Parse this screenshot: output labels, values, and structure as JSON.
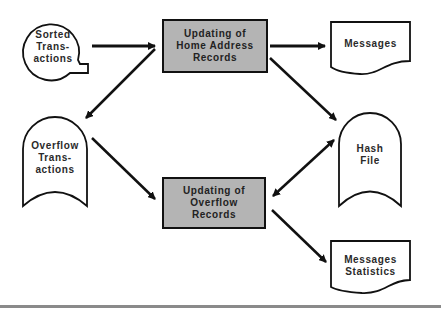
{
  "diagram": {
    "nodes": {
      "sorted_transactions": {
        "type": "terminal-tape",
        "label": "Sorted\nTrans-\nactions"
      },
      "update_home": {
        "type": "process",
        "label": "Updating of\nHome  Address\nRecords"
      },
      "messages": {
        "type": "document",
        "label": "Messages"
      },
      "overflow_transactions": {
        "type": "storage",
        "label": "Overflow\nTrans-\nactions"
      },
      "hash_file": {
        "type": "storage",
        "label": "Hash\nFile"
      },
      "update_overflow": {
        "type": "process",
        "label": "Updating of\nOverflow\nRecords"
      },
      "messages_statistics": {
        "type": "document",
        "label": "Messages\nStatistics"
      }
    },
    "edges": [
      {
        "from": "sorted_transactions",
        "to": "update_home"
      },
      {
        "from": "update_home",
        "to": "messages"
      },
      {
        "from": "update_home",
        "to": "overflow_transactions"
      },
      {
        "from": "update_home",
        "to": "hash_file"
      },
      {
        "from": "overflow_transactions",
        "to": "update_overflow"
      },
      {
        "from": "update_overflow",
        "to": "hash_file",
        "bidirectional": true
      },
      {
        "from": "update_overflow",
        "to": "messages_statistics"
      }
    ],
    "colors": {
      "process_fill": "#b4b4b4",
      "stroke": "#111111"
    }
  }
}
